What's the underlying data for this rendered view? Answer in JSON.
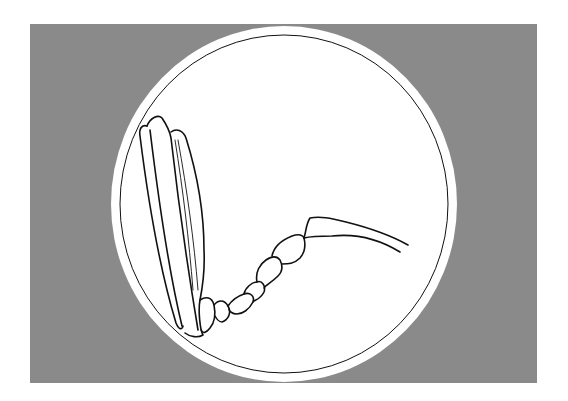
{
  "figure": {
    "colors": {
      "background": "#ffffff",
      "backdrop": "#8a8a8a",
      "disc": "#ffffff",
      "ink": "#111111"
    }
  }
}
